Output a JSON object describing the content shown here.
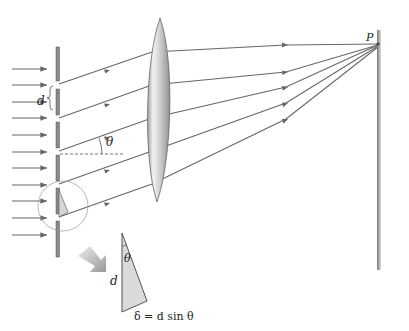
{
  "diagram": {
    "type": "diffraction-grating",
    "labels": {
      "point": "P",
      "spacing": "d",
      "angle": "θ",
      "inset_spacing": "d",
      "inset_angle": "θ",
      "path_difference": "δ = d sin θ"
    },
    "colors": {
      "ray": "#666666",
      "grating": "#888888",
      "lens_light": "#f2f2f2",
      "lens_dark": "#9a9a9a",
      "triangle_fill": "#d8d8d8",
      "arrow_gradient": "#bbbbbb"
    },
    "incident_arrow_count": 11,
    "ray_count": 5
  }
}
